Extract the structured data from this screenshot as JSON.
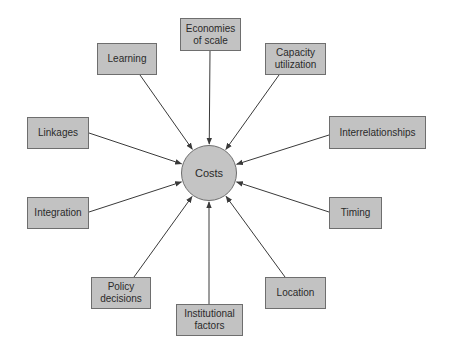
{
  "diagram": {
    "center": {
      "label": "Costs",
      "cx": 209,
      "cy": 173,
      "r": 28
    },
    "colors": {
      "box_fill": "#c2c2c2",
      "box_border": "#6e6e6e",
      "line": "#3a3a3a",
      "text": "#2a2a2a"
    },
    "drivers": [
      {
        "id": "economies-of-scale",
        "label": "Economies\nof scale",
        "x": 180,
        "y": 18,
        "w": 61,
        "h": 33
      },
      {
        "id": "learning",
        "label": "Learning",
        "x": 97,
        "y": 43,
        "w": 60,
        "h": 32
      },
      {
        "id": "capacity-utilization",
        "label": "Capacity\nutilization",
        "x": 265,
        "y": 43,
        "w": 61,
        "h": 32
      },
      {
        "id": "linkages",
        "label": "Linkages",
        "x": 27,
        "y": 117,
        "w": 62,
        "h": 32
      },
      {
        "id": "interrelationships",
        "label": "Interrelationships",
        "x": 329,
        "y": 116,
        "w": 97,
        "h": 33
      },
      {
        "id": "integration",
        "label": "Integration",
        "x": 27,
        "y": 197,
        "w": 62,
        "h": 32
      },
      {
        "id": "timing",
        "label": "Timing",
        "x": 329,
        "y": 197,
        "w": 53,
        "h": 32
      },
      {
        "id": "policy-decisions",
        "label": "Policy\ndecisions",
        "x": 91,
        "y": 277,
        "w": 60,
        "h": 32
      },
      {
        "id": "location",
        "label": "Location",
        "x": 265,
        "y": 277,
        "w": 61,
        "h": 32
      },
      {
        "id": "institutional-factors",
        "label": "Institutional\nfactors",
        "x": 176,
        "y": 304,
        "w": 67,
        "h": 32
      }
    ],
    "edges": [
      {
        "from": "economies-of-scale",
        "x1": 210,
        "y1": 51
      },
      {
        "from": "learning",
        "x1": 140,
        "y1": 75
      },
      {
        "from": "capacity-utilization",
        "x1": 279,
        "y1": 75
      },
      {
        "from": "linkages",
        "x1": 89,
        "y1": 133
      },
      {
        "from": "interrelationships",
        "x1": 329,
        "y1": 135
      },
      {
        "from": "integration",
        "x1": 89,
        "y1": 212
      },
      {
        "from": "timing",
        "x1": 329,
        "y1": 212
      },
      {
        "from": "policy-decisions",
        "x1": 134,
        "y1": 277
      },
      {
        "from": "location",
        "x1": 285,
        "y1": 277
      },
      {
        "from": "institutional-factors",
        "x1": 209,
        "y1": 304
      }
    ]
  }
}
